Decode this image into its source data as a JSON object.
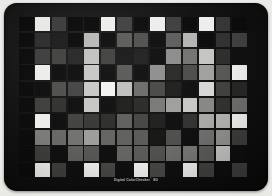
{
  "target": {
    "product_label": "Digital ColorChecker",
    "registered_mark": "®",
    "edition": "SG",
    "panel_color": "#0b0b0b",
    "surround_color": "#ededea",
    "grid": {
      "columns": 14,
      "rows": 10
    }
  },
  "chart_data": {
    "type": "heatmap",
    "columns": 14,
    "rows": 10,
    "xlabel": "",
    "ylabel": "",
    "note": "Underexposed photograph of an X-Rite Digital ColorChecker SG colour target; all patches render as low-luminance greys on a near-black panel.",
    "values": [
      [
        "#070707",
        "#e9e9e7",
        "#3a3a3a",
        "#070707",
        "#070707",
        "#efefed",
        "#3f3f3f",
        "#080808",
        "#efefed",
        "#3c3c3c",
        "#070707",
        "#efefed",
        "#343434",
        "#070707"
      ],
      [
        "#070707",
        "#2a2a2a",
        "#1a1a1a",
        "#070707",
        "#b9b9b7",
        "#0a0a0a",
        "#5a5a58",
        "#4e4e4c",
        "#0a0a0a",
        "#5c5c5a",
        "#b4b4b2",
        "#070707",
        "#2e2e2e",
        "#3d3d3b"
      ],
      [
        "#070707",
        "#3b3b3b",
        "#3f3f3d",
        "#242424",
        "#c2c2c0",
        "#3e3e3c",
        "#151515",
        "#1d1d1b",
        "#0a0a0a",
        "#8b8b89",
        "#72726f",
        "#c6c6c4",
        "#2a2a28",
        "#0a0a0a"
      ],
      [
        "#070707",
        "#eeeeec",
        "#0a0a0a",
        "#0a0a0a",
        "#c8c8c6",
        "#0a0a0a",
        "#56565 4",
        "#0a0a0a",
        "#8d8d8b",
        "#26262 4",
        "#4a4a48",
        "#a0a09e",
        "#545452",
        "#f0f0ee"
      ],
      [
        "#070707",
        "#0a0a0a",
        "#4c4c4a",
        "#414141",
        "#c9c9c7",
        "#f4f4f2",
        "#c0c0be",
        "#6a6a68",
        "#46464 4",
        "#1b1b19",
        "#0a0a0a",
        "#d7d7d5",
        "#3d3d3b",
        "#222220"
      ],
      [
        "#070707",
        "#3c3c3a",
        "#2e2e2c",
        "#0a0a0a",
        "#c6c6c4",
        "#0a0a0a",
        "#1a1a18",
        "#262624",
        "#77777 5",
        "#9e9e9c",
        "#c8c8c6",
        "#86868 4",
        "#2d2d2b",
        "#6b6b69"
      ],
      [
        "#070707",
        "#efefed",
        "#0a0a0a",
        "#3f3f3d",
        "#35353 3",
        "#2a2a28",
        "#5d5d5b",
        "#43434 1",
        "#1c1c1a",
        "#0a0a0a",
        "#2e2e2c",
        "#a8a8a6",
        "#b2b2b0",
        "#f2f2f0"
      ],
      [
        "#070707",
        "#7a7a78",
        "#66666 4",
        "#70706e",
        "#9c9c9a",
        "#62626 0",
        "#5e5e5c",
        "#585856",
        "#121210",
        "#4c4c4a",
        "#0a0a0a",
        "#6d6d6b",
        "#8f8f8d",
        "#3a3a38"
      ],
      [
        "#070707",
        "#3a3a38",
        "#0a0a0a",
        "#5b5b59",
        "#535351",
        "#0a0a0a",
        "#62626 0",
        "#58585 6",
        "#4e4e4c",
        "#6a6a68",
        "#75757 3",
        "#58585 6",
        "#c4c4c2",
        "#0a0a0a"
      ],
      [
        "#070707",
        "#f0f0ee",
        "#3b3b39",
        "#0a0a0a",
        "#efefed",
        "#43434 1",
        "#0a0a0a",
        "#f1f1ef",
        "#444442",
        "#0a0a0a",
        "#f0f0ee",
        "#3e3e3c",
        "#0a0a0a",
        "#3b3b39"
      ]
    ]
  }
}
